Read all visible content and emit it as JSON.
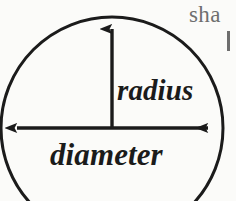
{
  "figure": {
    "kind": "circle-radius-diameter-diagram",
    "background_color": "#fbfbf9",
    "ink_color": "#1b1b1b",
    "body_text_color": "#6e6e6e",
    "canvas": {
      "width": 236,
      "height": 201
    },
    "circle": {
      "center_x": 112,
      "center_y": 128,
      "radius": 111,
      "stroke_width": 3,
      "note": "clipped by bottom and left edges of the crop"
    },
    "radius_arrow": {
      "label": "radius",
      "from_x": 112,
      "from_y": 128,
      "to_x": 112,
      "to_y": 17,
      "arrowheads": "single, at top"
    },
    "diameter_arrow": {
      "label": "diameter",
      "from_x": 4,
      "from_y": 128,
      "to_x": 221,
      "to_y": 128,
      "arrowheads": "double, both ends"
    }
  },
  "labels": {
    "radius": "radius",
    "diameter": "diameter"
  },
  "surrounding_text": {
    "line1": "sha",
    "line2": "l"
  }
}
